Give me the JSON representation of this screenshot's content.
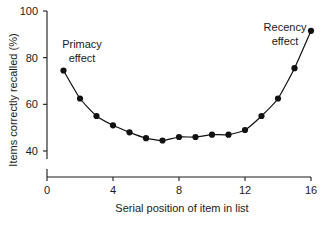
{
  "chart_data": {
    "type": "line",
    "title": "",
    "xlabel": "Serial position of item in list",
    "ylabel": "Items correctly recalled (%)",
    "x": [
      1,
      2,
      3,
      4,
      5,
      6,
      7,
      8,
      9,
      10,
      11,
      12,
      13,
      14,
      15,
      16
    ],
    "values": [
      74.5,
      62.5,
      55.0,
      51.0,
      48.0,
      45.5,
      44.5,
      46.0,
      46.0,
      47.0,
      47.0,
      49.0,
      55.0,
      62.5,
      75.5,
      91.5
    ],
    "series": [
      {
        "name": "Items correctly recalled",
        "values": [
          74.5,
          62.5,
          55.0,
          51.0,
          48.0,
          45.5,
          44.5,
          46.0,
          46.0,
          47.0,
          47.0,
          49.0,
          55.0,
          62.5,
          75.5,
          91.5
        ]
      }
    ],
    "xlim": [
      0,
      16
    ],
    "ylim": [
      35,
      100
    ],
    "xticks": [
      0,
      4,
      8,
      12,
      16
    ],
    "yticks": [
      40,
      60,
      80,
      100
    ],
    "xtick_labels": [
      "0",
      "4",
      "8",
      "12",
      "16"
    ],
    "ytick_labels": [
      "40",
      "60",
      "80",
      "100"
    ],
    "grid": false,
    "legend": null,
    "marker": "filled-circle",
    "line_color": "#111111",
    "marker_color": "#111111",
    "background_color": "#ffffff",
    "annotations": [
      {
        "id": "primacy",
        "text_line1": "Primacy",
        "text_line2": "effect",
        "x": 1.5,
        "y": 86
      },
      {
        "id": "recency",
        "text_line1": "Recency",
        "text_line2": "effect",
        "x": 13.3,
        "y": 95
      }
    ]
  }
}
